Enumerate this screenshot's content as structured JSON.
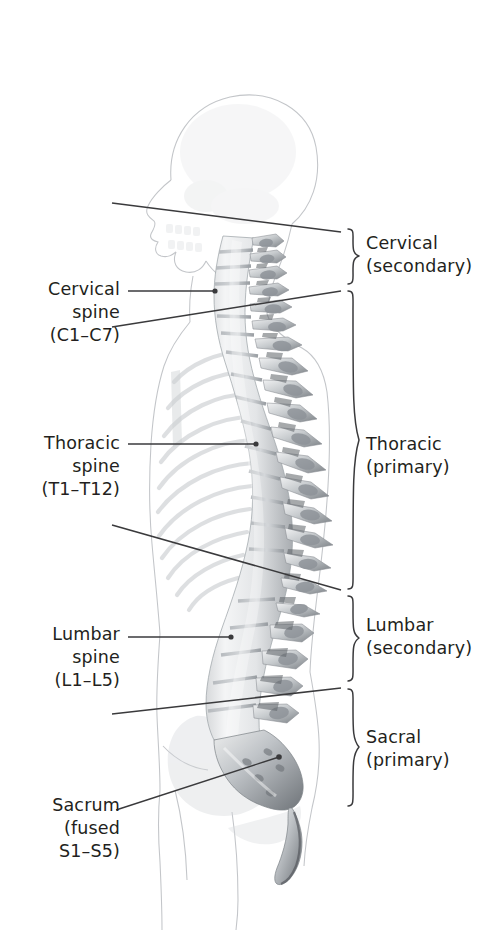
{
  "figure": {
    "ink_color": "#231f20",
    "line_color": "#3a3a3c",
    "ghost_color": "#b9bcc0"
  },
  "labels_left": [
    {
      "id": "cervical-spine",
      "text": "Cervical\nspine\n(C1–C7)",
      "leader": {
        "x1": 128,
        "y1": 291,
        "x2": 215,
        "y2": 291,
        "dot": true
      }
    },
    {
      "id": "thoracic-spine",
      "text": "Thoracic\nspine\n(T1–T12)",
      "leader": {
        "x1": 128,
        "y1": 444,
        "x2": 256,
        "y2": 444,
        "dot": true
      }
    },
    {
      "id": "lumbar-spine",
      "text": "Lumbar\nspine\n(L1–L5)",
      "leader": {
        "x1": 128,
        "y1": 637,
        "x2": 231,
        "y2": 637,
        "dot": true
      }
    },
    {
      "id": "sacrum",
      "text": "Sacrum\n(fused\nS1–S5)",
      "leader": {
        "x1": 116,
        "y1": 810,
        "x2": 279,
        "y2": 757,
        "dot": true
      }
    }
  ],
  "labels_right": [
    {
      "id": "cervical-curve",
      "text": "Cervical\n(secondary)",
      "brace_top": 229,
      "brace_bottom": 284
    },
    {
      "id": "thoracic-curve",
      "text": "Thoracic\n(primary)",
      "brace_top": 291,
      "brace_bottom": 589
    },
    {
      "id": "lumbar-curve",
      "text": "Lumbar\n(secondary)",
      "brace_top": 596,
      "brace_bottom": 681
    },
    {
      "id": "sacral-curve",
      "text": "Sacral\n(primary)",
      "brace_top": 689,
      "brace_bottom": 806
    }
  ],
  "divider_lines": [
    {
      "id": "skull-cervical-divider",
      "x1": 112,
      "y1": 203,
      "x2": 341,
      "y2": 232
    },
    {
      "id": "cervical-thoracic-divider",
      "x1": 112,
      "y1": 327,
      "x2": 341,
      "y2": 291
    },
    {
      "id": "thoracic-lumbar-divider",
      "x1": 112,
      "y1": 525,
      "x2": 341,
      "y2": 590
    },
    {
      "id": "lumbar-sacral-divider",
      "x1": 112,
      "y1": 714,
      "x2": 341,
      "y2": 688
    }
  ]
}
